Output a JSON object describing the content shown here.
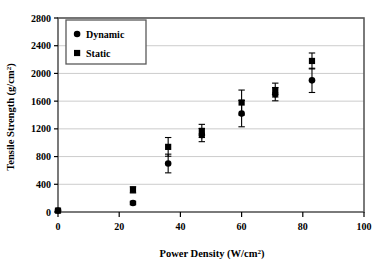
{
  "chart_data": {
    "type": "scatter",
    "title": "",
    "xlabel": "Power Density (W/cm²)",
    "ylabel": "Tensile Strength (g/cm²)",
    "xlim": [
      0,
      100
    ],
    "ylim": [
      0,
      2800
    ],
    "xticks": [
      0,
      20,
      40,
      60,
      80,
      100
    ],
    "yticks": [
      0,
      400,
      800,
      1200,
      1600,
      2000,
      2400,
      2800
    ],
    "xtick_labels": [
      "0",
      "20",
      "40",
      "60",
      "80",
      "100"
    ],
    "ytick_labels": [
      "0",
      "400",
      "800",
      "1200",
      "1600",
      "2000",
      "2400",
      "2800"
    ],
    "grid": "horizontal",
    "legend_position": "top-left",
    "series": [
      {
        "name": "Dynamic",
        "marker": "circle",
        "color": "#000000",
        "points": [
          {
            "x": 0,
            "y": 20,
            "err": 0
          },
          {
            "x": 24.5,
            "y": 130,
            "err": 25
          },
          {
            "x": 36,
            "y": 700,
            "err": 135
          },
          {
            "x": 47,
            "y": 1110,
            "err": 95
          },
          {
            "x": 60,
            "y": 1420,
            "err": 190
          },
          {
            "x": 71,
            "y": 1700,
            "err": 95
          },
          {
            "x": 83,
            "y": 1900,
            "err": 175
          }
        ]
      },
      {
        "name": "Static",
        "marker": "square",
        "color": "#000000",
        "points": [
          {
            "x": 0,
            "y": 20,
            "err": 0
          },
          {
            "x": 24.5,
            "y": 320,
            "err": 45
          },
          {
            "x": 36,
            "y": 940,
            "err": 135
          },
          {
            "x": 47,
            "y": 1170,
            "err": 95
          },
          {
            "x": 60,
            "y": 1580,
            "err": 180
          },
          {
            "x": 71,
            "y": 1760,
            "err": 100
          },
          {
            "x": 83,
            "y": 2180,
            "err": 115
          }
        ]
      }
    ]
  },
  "legend": {
    "items": [
      {
        "label": "Dynamic",
        "marker": "circle"
      },
      {
        "label": "Static",
        "marker": "square"
      }
    ]
  },
  "axes": {
    "y_title_main": "Tensile Strength (g/cm",
    "y_title_sup": "2",
    "y_title_close": ")",
    "x_title_main": "Power Density (W/cm",
    "x_title_sup": "2",
    "x_title_close": ")"
  },
  "colors": {
    "marker": "#000000",
    "frame": "#595959",
    "gridline": "#bfbfbf",
    "background": "#ffffff"
  }
}
